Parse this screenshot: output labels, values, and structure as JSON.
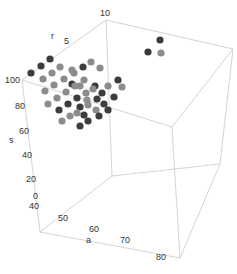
{
  "chart_data": {
    "type": "scatter3d",
    "title": "",
    "axes": {
      "a": {
        "label": "a",
        "ticks": [
          "40",
          "50",
          "60",
          "70",
          "80"
        ],
        "range": [
          40,
          80
        ]
      },
      "s": {
        "label": "s",
        "ticks": [
          "0",
          "20",
          "40",
          "60",
          "80",
          "100"
        ],
        "range": [
          0,
          100
        ]
      },
      "r": {
        "label": "r",
        "ticks": [
          "5",
          "10"
        ],
        "range": [
          0,
          10
        ]
      }
    },
    "colors": {
      "dark": "#3c3c3c",
      "gray": "#8c8c8c",
      "edge": "#c8c8c8"
    },
    "points_screen": [
      {
        "x": 50,
        "y": 59,
        "c": "dark"
      },
      {
        "x": 41,
        "y": 66,
        "c": "dark"
      },
      {
        "x": 31,
        "y": 73,
        "c": "dark"
      },
      {
        "x": 60,
        "y": 67,
        "c": "gray"
      },
      {
        "x": 52,
        "y": 73,
        "c": "gray"
      },
      {
        "x": 43,
        "y": 79,
        "c": "gray"
      },
      {
        "x": 91,
        "y": 62,
        "c": "gray"
      },
      {
        "x": 83,
        "y": 67,
        "c": "dark"
      },
      {
        "x": 74,
        "y": 73,
        "c": "gray"
      },
      {
        "x": 64,
        "y": 79,
        "c": "gray"
      },
      {
        "x": 54,
        "y": 85,
        "c": "gray"
      },
      {
        "x": 45,
        "y": 91,
        "c": "gray"
      },
      {
        "x": 100,
        "y": 68,
        "c": "gray"
      },
      {
        "x": 72,
        "y": 84,
        "c": "dark"
      },
      {
        "x": 84,
        "y": 80,
        "c": "gray"
      },
      {
        "x": 75,
        "y": 86,
        "c": "gray"
      },
      {
        "x": 66,
        "y": 92,
        "c": "gray"
      },
      {
        "x": 57,
        "y": 98,
        "c": "gray"
      },
      {
        "x": 48,
        "y": 104,
        "c": "gray"
      },
      {
        "x": 95,
        "y": 86,
        "c": "dark"
      },
      {
        "x": 93,
        "y": 89,
        "c": "gray"
      },
      {
        "x": 86,
        "y": 93,
        "c": "gray"
      },
      {
        "x": 77,
        "y": 98,
        "c": "dark"
      },
      {
        "x": 68,
        "y": 104,
        "c": "dark"
      },
      {
        "x": 59,
        "y": 110,
        "c": "dark"
      },
      {
        "x": 108,
        "y": 86,
        "c": "gray"
      },
      {
        "x": 102,
        "y": 93,
        "c": "dark"
      },
      {
        "x": 97,
        "y": 99,
        "c": "dark"
      },
      {
        "x": 87,
        "y": 100,
        "c": "gray"
      },
      {
        "x": 88,
        "y": 105,
        "c": "gray"
      },
      {
        "x": 80,
        "y": 107,
        "c": "dark"
      },
      {
        "x": 70,
        "y": 116,
        "c": "gray"
      },
      {
        "x": 104,
        "y": 104,
        "c": "dark"
      },
      {
        "x": 96,
        "y": 110,
        "c": "gray"
      },
      {
        "x": 108,
        "y": 110,
        "c": "dark"
      },
      {
        "x": 99,
        "y": 116,
        "c": "dark"
      },
      {
        "x": 88,
        "y": 121,
        "c": "dark"
      },
      {
        "x": 80,
        "y": 126,
        "c": "dark"
      },
      {
        "x": 77,
        "y": 113,
        "c": "gray"
      },
      {
        "x": 84,
        "y": 115,
        "c": "dark"
      },
      {
        "x": 62,
        "y": 121,
        "c": "gray"
      },
      {
        "x": 114,
        "y": 97,
        "c": "dark"
      },
      {
        "x": 118,
        "y": 80,
        "c": "dark"
      },
      {
        "x": 122,
        "y": 87,
        "c": "gray"
      },
      {
        "x": 160,
        "y": 40,
        "c": "dark"
      },
      {
        "x": 148,
        "y": 52,
        "c": "dark"
      },
      {
        "x": 161,
        "y": 53,
        "c": "gray"
      },
      {
        "x": 72,
        "y": 70,
        "c": "gray"
      },
      {
        "x": 80,
        "y": 86,
        "c": "gray"
      }
    ]
  },
  "labels": {
    "a_axis": "a",
    "s_axis": "s",
    "r_axis": "r",
    "a_ticks": [
      "40",
      "50",
      "60",
      "70",
      "80"
    ],
    "s_ticks": [
      "0",
      "20",
      "40",
      "60",
      "80",
      "100"
    ],
    "r_ticks": [
      "5",
      "10"
    ]
  }
}
